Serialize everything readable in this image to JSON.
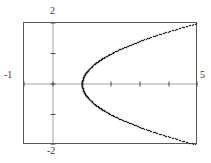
{
  "figure": {
    "part_label": ")",
    "axis_labels": {
      "top": "2",
      "bottom": "-2",
      "left": "-1",
      "right": "5"
    }
  },
  "chart_data": {
    "type": "scatter",
    "title": "",
    "xlabel": "",
    "ylabel": "",
    "equation": "x = y^2 + 1",
    "xlim": [
      -1,
      5
    ],
    "ylim": [
      -2,
      2
    ],
    "xtick_labels": [
      "-1",
      "5"
    ],
    "ytick_labels": [
      "-2",
      "2"
    ],
    "xtick_label_positions": [
      -1,
      5
    ],
    "ytick_label_positions": [
      -2,
      2
    ],
    "xscl": 1,
    "yscl": 1,
    "grid": false,
    "axes_style": "dotted",
    "vertex": [
      1,
      0
    ],
    "legend": null,
    "series": [
      {
        "name": "upper branch",
        "x": [
          1.0,
          1.02,
          1.06,
          1.13,
          1.22,
          1.36,
          1.52,
          1.72,
          1.96,
          2.23,
          2.54,
          2.88,
          3.25,
          3.67,
          4.11,
          4.6,
          5.0
        ],
        "y": [
          0.0,
          0.15,
          0.25,
          0.36,
          0.47,
          0.6,
          0.72,
          0.85,
          0.98,
          1.11,
          1.24,
          1.37,
          1.5,
          1.63,
          1.76,
          1.9,
          2.0
        ]
      },
      {
        "name": "lower branch",
        "x": [
          1.0,
          1.02,
          1.06,
          1.13,
          1.22,
          1.36,
          1.52,
          1.72,
          1.96,
          2.23,
          2.54,
          2.88,
          3.25,
          3.67,
          4.11,
          4.6,
          5.0
        ],
        "y": [
          0.0,
          -0.15,
          -0.25,
          -0.36,
          -0.47,
          -0.6,
          -0.72,
          -0.85,
          -0.98,
          -1.11,
          -1.24,
          -1.37,
          -1.5,
          -1.63,
          -1.76,
          -1.9,
          -2.0
        ]
      }
    ],
    "colors": {
      "curve": "#262626",
      "axis": "#4a4a4a",
      "frame": "#555a5e",
      "background": "#ffffff"
    }
  }
}
